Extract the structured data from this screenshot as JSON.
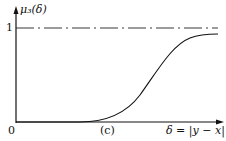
{
  "figure": {
    "y_label": "μ₃(δ)",
    "y_tick": "1",
    "origin": "0",
    "x_label": "δ = |y − x|",
    "caption": "(c)"
  },
  "curve": {
    "type": "sigmoid",
    "description": "membership function rising from 0 to approach 1 asymptote"
  }
}
